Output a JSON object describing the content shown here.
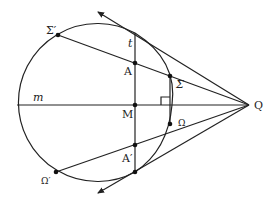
{
  "diagram": {
    "title": "",
    "labels": {
      "sigma_prime": "Σ′",
      "t": "t",
      "A": "A",
      "sigma": "Σ",
      "m": "m",
      "M": "M",
      "Q": "Q",
      "omega": "Ω",
      "A_prime": "A′",
      "omega_prime": "Ω′"
    },
    "points": {
      "Q": [
        249,
        105
      ],
      "M": [
        135,
        105
      ],
      "A": [
        135,
        63
      ],
      "A_prime": [
        135,
        145
      ],
      "T_top": [
        135,
        33
      ],
      "T_bottom": [
        135,
        172
      ],
      "sigma": [
        170,
        76
      ],
      "omega": [
        170,
        124
      ],
      "sigma_prime": [
        58,
        35
      ],
      "omega_prime": [
        56,
        172
      ]
    },
    "circle": {
      "cx": 96,
      "cy": 103,
      "r": 79
    },
    "colors": {
      "stroke": "#222222",
      "background": "#ffffff"
    }
  }
}
